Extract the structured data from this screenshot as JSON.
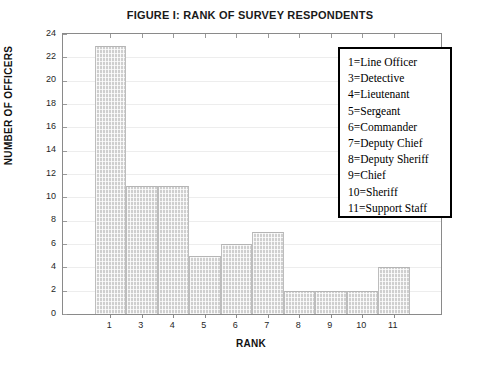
{
  "chart_data": {
    "type": "bar",
    "title": "FIGURE I:  RANK OF SURVEY RESPONDENTS",
    "xlabel": "RANK",
    "ylabel": "NUMBER OF OFFICERS",
    "categories": [
      "1",
      "3",
      "4",
      "5",
      "6",
      "7",
      "8",
      "9",
      "10",
      "11"
    ],
    "values": [
      23,
      11,
      11,
      5,
      6,
      7,
      2,
      2,
      2,
      4
    ],
    "ylim": [
      0,
      24
    ],
    "ytick_labels": [
      "24",
      "22",
      "20",
      "18",
      "16",
      "14",
      "12",
      "10",
      "8",
      "6",
      "4",
      "2",
      "0"
    ],
    "ytick_values": [
      24,
      22,
      20,
      18,
      16,
      14,
      12,
      10,
      8,
      6,
      4,
      2,
      0
    ],
    "ytick_step": 2,
    "xtick_labels": [
      "1",
      "3",
      "4",
      "5",
      "6",
      "7",
      "8",
      "9",
      "10",
      "11"
    ],
    "grid": true,
    "legend_position": "top-right",
    "bar_color": "#cfcfcf",
    "frame_color": "#8a8a8a",
    "grid_color": "#ededed",
    "legend_entries": [
      "1=Line Officer",
      "3=Detective",
      "4=Lieutenant",
      "5=Sergeant",
      "6=Commander",
      "7=Deputy Chief",
      "8=Deputy Sheriff",
      "9=Chief",
      "10=Sheriff",
      "11=Support Staff"
    ]
  }
}
